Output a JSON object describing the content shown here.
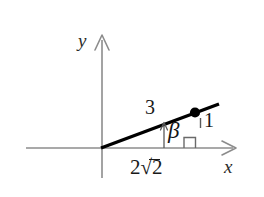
{
  "figure": {
    "axes": {
      "x_label": "x",
      "y_label": "y",
      "axis_color": "#8c8c8c"
    },
    "ray": {
      "color": "#000000",
      "description": "ray-from-origin"
    },
    "point": {
      "marker": "filled-dot",
      "color": "#000000"
    },
    "labels": {
      "opposite_side": "3",
      "vertical_leg": "1",
      "adjacent_side_prefix": "2",
      "adjacent_side_radicand": "2",
      "adjacent_side_full": "2√2",
      "angle": "β"
    },
    "marks": {
      "right_angle": "right-angle-square",
      "measure_arrow": "up-arrow-tick"
    }
  }
}
